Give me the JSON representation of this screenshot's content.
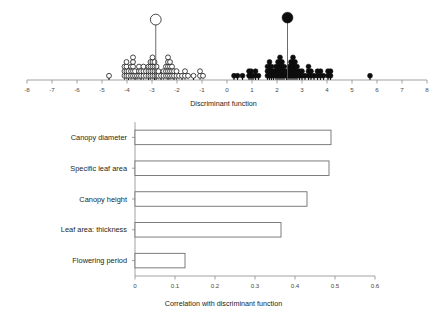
{
  "figure": {
    "name": "discriminant-function-figure",
    "panels": [
      "dot-histogram",
      "correlation-bar-chart"
    ]
  },
  "chart_data": [
    {
      "type": "scatter",
      "name": "discriminant-function-dot-histogram",
      "title": "",
      "xlabel": "Discriminant function",
      "ylabel": "",
      "xlim": [
        -8,
        8
      ],
      "xticks": [
        -8,
        -7,
        -6,
        -5,
        -4,
        -3,
        -2,
        -1,
        0,
        1,
        2,
        3,
        4,
        5,
        6,
        7,
        8
      ],
      "xticklabels": [
        "-8",
        "-7",
        "-6",
        "-5",
        "-4",
        "-3",
        "-2",
        "-1",
        "0",
        "1",
        "2",
        "3",
        "4",
        "5",
        "6",
        "7",
        "8"
      ],
      "grid": false,
      "legend": "none",
      "series": [
        {
          "name": "group-open-circles",
          "marker": "open-circle",
          "color": "#ffffff",
          "edge_color": "#1a1a1a",
          "stacks": [
            {
              "x": -4.72,
              "count": 1
            },
            {
              "x": -4.1,
              "count": 3
            },
            {
              "x": -4.02,
              "count": 4
            },
            {
              "x": -3.94,
              "count": 2
            },
            {
              "x": -3.84,
              "count": 3
            },
            {
              "x": -3.76,
              "count": 5
            },
            {
              "x": -3.68,
              "count": 2
            },
            {
              "x": -3.6,
              "count": 1
            },
            {
              "x": -3.52,
              "count": 3
            },
            {
              "x": -3.44,
              "count": 2
            },
            {
              "x": -3.34,
              "count": 3
            },
            {
              "x": -3.24,
              "count": 2
            },
            {
              "x": -3.14,
              "count": 3
            },
            {
              "x": -3.06,
              "count": 4
            },
            {
              "x": -2.98,
              "count": 5
            },
            {
              "x": -2.9,
              "count": 4
            },
            {
              "x": -2.82,
              "count": 3
            },
            {
              "x": -2.74,
              "count": 2
            },
            {
              "x": -2.64,
              "count": 1
            },
            {
              "x": -2.54,
              "count": 2
            },
            {
              "x": -2.44,
              "count": 3
            },
            {
              "x": -2.36,
              "count": 5
            },
            {
              "x": -2.28,
              "count": 4
            },
            {
              "x": -2.2,
              "count": 3
            },
            {
              "x": -2.12,
              "count": 2
            },
            {
              "x": -2.02,
              "count": 2
            },
            {
              "x": -1.92,
              "count": 1
            },
            {
              "x": -1.8,
              "count": 1
            },
            {
              "x": -1.68,
              "count": 2
            },
            {
              "x": -1.56,
              "count": 1
            },
            {
              "x": -1.34,
              "count": 1
            },
            {
              "x": -1.08,
              "count": 2
            },
            {
              "x": -0.96,
              "count": 1
            }
          ],
          "highlight": {
            "x": -2.85,
            "label": "group-centroid-open",
            "stem_height": 56,
            "radius": 5.4
          }
        },
        {
          "name": "group-filled-circles",
          "marker": "filled-circle",
          "color": "#0d0d0d",
          "edge_color": "#0d0d0d",
          "stacks": [
            {
              "x": 0.28,
              "count": 1
            },
            {
              "x": 0.42,
              "count": 1
            },
            {
              "x": 0.62,
              "count": 1
            },
            {
              "x": 0.88,
              "count": 2
            },
            {
              "x": 0.96,
              "count": 2
            },
            {
              "x": 1.04,
              "count": 1
            },
            {
              "x": 1.14,
              "count": 2
            },
            {
              "x": 1.26,
              "count": 1
            },
            {
              "x": 1.62,
              "count": 3
            },
            {
              "x": 1.7,
              "count": 4
            },
            {
              "x": 1.78,
              "count": 3
            },
            {
              "x": 1.86,
              "count": 2
            },
            {
              "x": 1.96,
              "count": 3
            },
            {
              "x": 2.04,
              "count": 4
            },
            {
              "x": 2.12,
              "count": 5
            },
            {
              "x": 2.2,
              "count": 4
            },
            {
              "x": 2.28,
              "count": 3
            },
            {
              "x": 2.38,
              "count": 2
            },
            {
              "x": 2.48,
              "count": 3
            },
            {
              "x": 2.56,
              "count": 4
            },
            {
              "x": 2.64,
              "count": 5
            },
            {
              "x": 2.72,
              "count": 4
            },
            {
              "x": 2.8,
              "count": 3
            },
            {
              "x": 2.9,
              "count": 2
            },
            {
              "x": 3.0,
              "count": 2
            },
            {
              "x": 3.12,
              "count": 1
            },
            {
              "x": 3.26,
              "count": 3
            },
            {
              "x": 3.36,
              "count": 2
            },
            {
              "x": 3.48,
              "count": 1
            },
            {
              "x": 3.62,
              "count": 2
            },
            {
              "x": 3.74,
              "count": 2
            },
            {
              "x": 3.86,
              "count": 1
            },
            {
              "x": 4.04,
              "count": 2
            },
            {
              "x": 4.14,
              "count": 2
            },
            {
              "x": 5.72,
              "count": 1
            }
          ],
          "highlight": {
            "x": 2.42,
            "label": "group-centroid-filled",
            "stem_height": 58,
            "radius": 5.4
          }
        }
      ]
    },
    {
      "type": "bar",
      "name": "correlation-with-discriminant-function",
      "orientation": "horizontal",
      "title": "",
      "xlabel": "Correlation with discriminant function",
      "ylabel": "",
      "xlim": [
        0,
        0.6
      ],
      "xticks": [
        0,
        0.1,
        0.2,
        0.3,
        0.4,
        0.5,
        0.6
      ],
      "xticklabels": [
        "0",
        "0.1",
        "0.2",
        "0.3",
        "0.4",
        "0.5",
        "0.6"
      ],
      "grid": false,
      "legend": "none",
      "categories": [
        "Canopy diameter",
        "Specific leaf area",
        "Canopy height",
        "Leaf area: thickness",
        "Flowering period"
      ],
      "values": [
        0.49,
        0.485,
        0.43,
        0.365,
        0.125
      ],
      "bar_fill": "#ffffff",
      "bar_edge": "#6f6f6f"
    }
  ]
}
